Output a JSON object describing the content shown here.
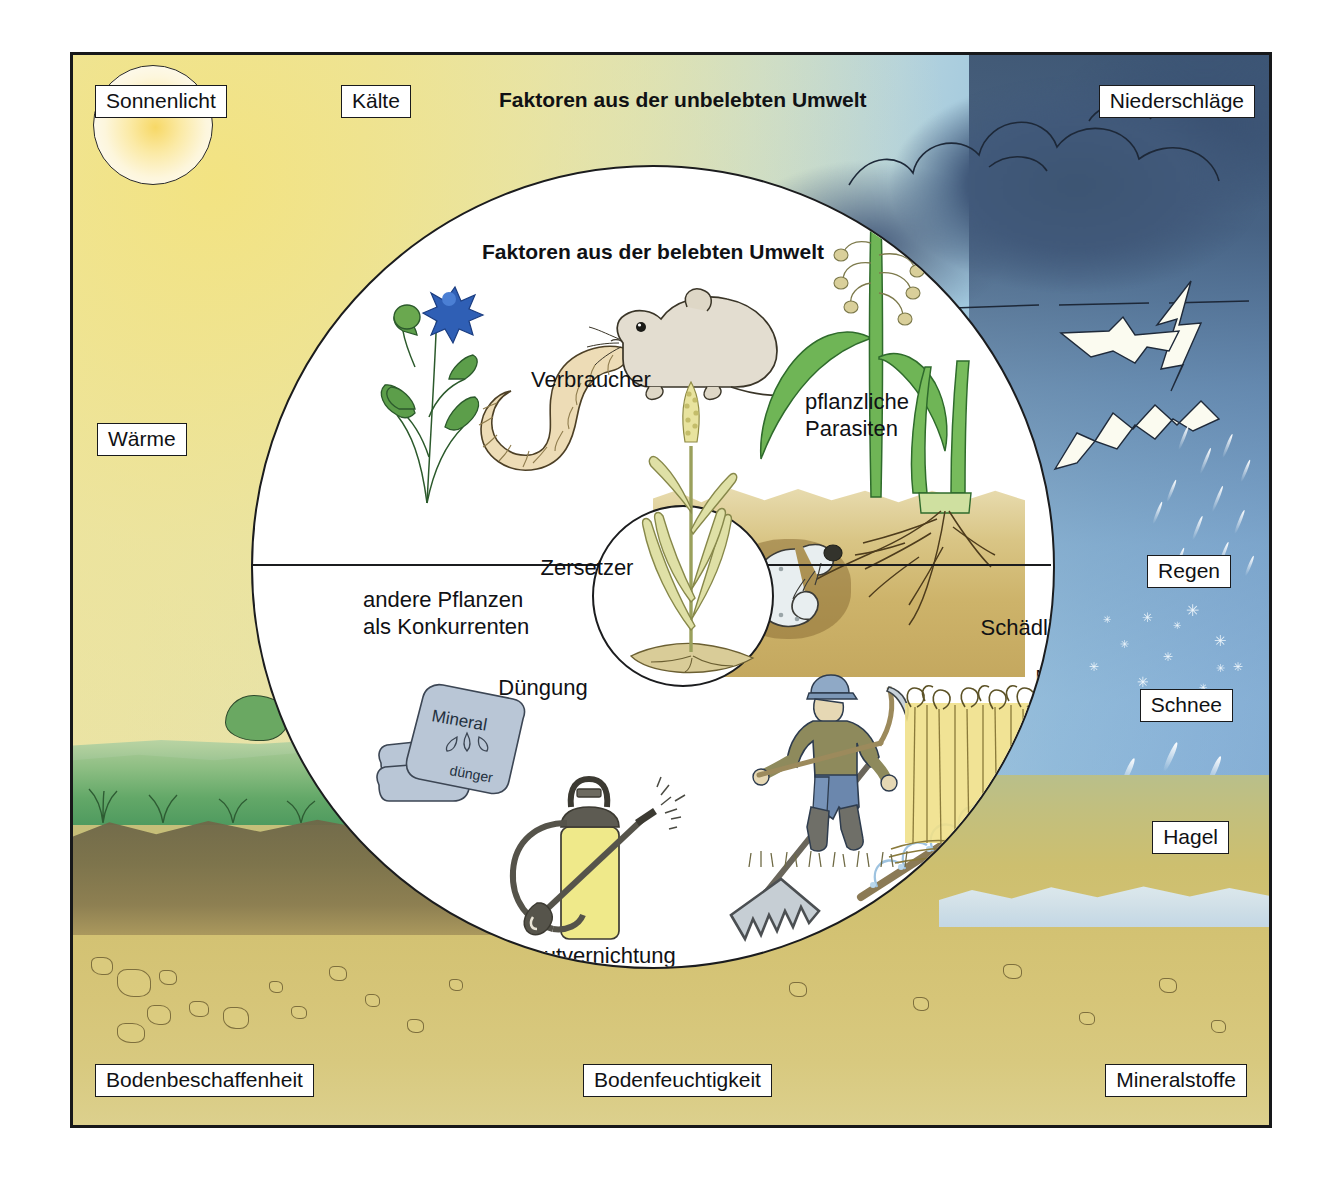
{
  "diagram": {
    "title_outer": "Faktoren aus der unbelebten Umwelt",
    "title_inner": "Faktoren aus der belebten Umwelt",
    "title_human": "Einflüsse des Menschen"
  },
  "abiotic_labels": [
    {
      "id": "sonnenlicht",
      "label": "Sonnenlicht"
    },
    {
      "id": "kaelte",
      "label": "Kälte"
    },
    {
      "id": "niederschlaege",
      "label": "Niederschläge"
    },
    {
      "id": "waerme",
      "label": "Wärme"
    },
    {
      "id": "regen",
      "label": "Regen"
    },
    {
      "id": "schnee",
      "label": "Schnee"
    },
    {
      "id": "hagel",
      "label": "Hagel"
    },
    {
      "id": "bodenbeschaffenheit",
      "label": "Bodenbeschaffenheit"
    },
    {
      "id": "bodenfeuchtigkeit",
      "label": "Bodenfeuchtigkeit"
    },
    {
      "id": "mineralstoffe",
      "label": "Mineralstoffe"
    }
  ],
  "biotic_labels": [
    {
      "id": "verbraucher",
      "label": "Verbraucher"
    },
    {
      "id": "zersetzer",
      "label": "Zersetzer"
    },
    {
      "id": "konkurrenten",
      "label": "andere Pflanzen\nals Konkurrenten"
    },
    {
      "id": "pflanzliche-parasiten",
      "label": "pflanzliche\nParasiten"
    },
    {
      "id": "schaedlinge",
      "label": "Schädlinge"
    }
  ],
  "human_labels": [
    {
      "id": "duengung",
      "label": "Düngung"
    },
    {
      "id": "maehen-ernten",
      "label": "Mähen und Ernten"
    },
    {
      "id": "unkraut",
      "label": "Unkrautvernichtung\nSchädlingsbekämpfung"
    },
    {
      "id": "bodenbearbeitung",
      "label": "Bodenbearbeitung\nund Bewässerung"
    }
  ],
  "illustrations": {
    "fertilizer_bag_text": "Mineral",
    "fertilizer_bag_text2": "dünger"
  },
  "colors": {
    "frame_border": "#17181a",
    "sun": "#f7d866",
    "sky_warm": "#ece4a6",
    "sky_cool": "#6f9fce",
    "storm": "#41597a",
    "soil": "#cdbf6f",
    "meadow": "#63a868",
    "circle_fill": "#ffffff",
    "text": "#101114"
  }
}
